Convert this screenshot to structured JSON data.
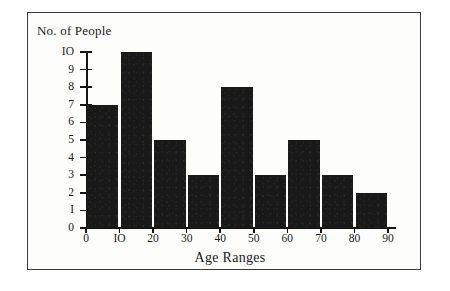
{
  "figure": {
    "background_color": "#fdfdfb",
    "ink_color": "#191919",
    "frame_color": "#3a3a3a"
  },
  "chart_data": {
    "type": "bar",
    "title": "",
    "xlabel": "Age Ranges",
    "ylabel": "No. of People",
    "categories": [
      "0-10",
      "10-20",
      "20-30",
      "30-40",
      "40-50",
      "50-60",
      "60-70",
      "70-80",
      "80-90"
    ],
    "values": [
      7,
      10,
      5,
      3,
      8,
      3,
      5,
      3,
      2
    ],
    "x_tick_labels": [
      "0",
      "10",
      "20",
      "30",
      "40",
      "50",
      "60",
      "70",
      "80",
      "90"
    ],
    "x_tick_values": [
      0,
      10,
      20,
      30,
      40,
      50,
      60,
      70,
      80,
      90
    ],
    "y_tick_labels": [
      "0",
      "1",
      "2",
      "3",
      "4",
      "5",
      "6",
      "7",
      "8",
      "9",
      "10"
    ],
    "y_tick_values": [
      0,
      1,
      2,
      3,
      4,
      5,
      6,
      7,
      8,
      9,
      10
    ],
    "xlim": [
      0,
      90
    ],
    "ylim": [
      0,
      10
    ],
    "grid": false,
    "legend": false,
    "bar_color": "#191919"
  }
}
